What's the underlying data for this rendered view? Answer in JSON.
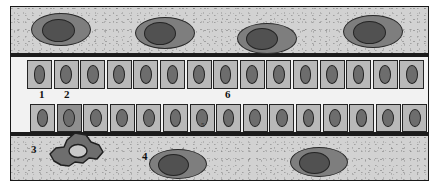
{
  "figure": {
    "background_color": "#ffffff",
    "frame_color": "#1a1a1a",
    "tissue_color": "#d2d2d2",
    "band_color": "#1b1b1b"
  },
  "labels": [
    {
      "id": "label-1",
      "text": "1",
      "x": 38,
      "y": 88,
      "size": "normal"
    },
    {
      "id": "label-2",
      "text": "2",
      "x": 63,
      "y": 88,
      "size": "normal"
    },
    {
      "id": "label-3",
      "text": "3",
      "x": 30,
      "y": 143,
      "size": "normal"
    },
    {
      "id": "label-4",
      "text": "4",
      "x": 141,
      "y": 150,
      "size": "normal"
    },
    {
      "id": "label-5",
      "text": "5",
      "x": 200,
      "y": 121,
      "size": "tiny"
    },
    {
      "id": "label-6",
      "text": "6",
      "x": 224,
      "y": 88,
      "size": "normal"
    }
  ],
  "layers": {
    "top_squamous": {
      "name": "top squamous cell layer",
      "cell_count": 4,
      "cells": [
        {
          "x": 30,
          "y": 12,
          "w": 58,
          "h": 31,
          "nx": 10,
          "ny": 5,
          "nw": 31,
          "nh": 21
        },
        {
          "x": 134,
          "y": 16,
          "w": 58,
          "h": 30,
          "nx": 8,
          "ny": 4,
          "nw": 30,
          "nh": 21
        },
        {
          "x": 236,
          "y": 22,
          "w": 58,
          "h": 29,
          "nx": 8,
          "ny": 4,
          "nw": 30,
          "nh": 20
        },
        {
          "x": 342,
          "y": 14,
          "w": 58,
          "h": 31,
          "nx": 9,
          "ny": 5,
          "nw": 31,
          "nh": 21
        }
      ]
    },
    "upper_cuboidal": {
      "name": "upper cuboidal epithelium row",
      "cell_count": 15,
      "dark_cell_indices": []
    },
    "lower_cuboidal": {
      "name": "lower cuboidal epithelium row",
      "cell_count": 15,
      "dark_cell_indices": [
        1
      ]
    },
    "bottom_connective": {
      "name": "bottom connective tissue layer",
      "cell_count": 2,
      "cells": [
        {
          "x": 148,
          "y": 148,
          "w": 56,
          "h": 28,
          "nx": 8,
          "ny": 4,
          "nw": 29,
          "nh": 20
        },
        {
          "x": 289,
          "y": 146,
          "w": 56,
          "h": 28,
          "nx": 8,
          "ny": 4,
          "nw": 29,
          "nh": 20
        }
      ],
      "irregular_cell": {
        "name": "irregular amoeboid cell",
        "fill": "#6e6e6e",
        "stroke": "#1f1f1f"
      }
    }
  }
}
